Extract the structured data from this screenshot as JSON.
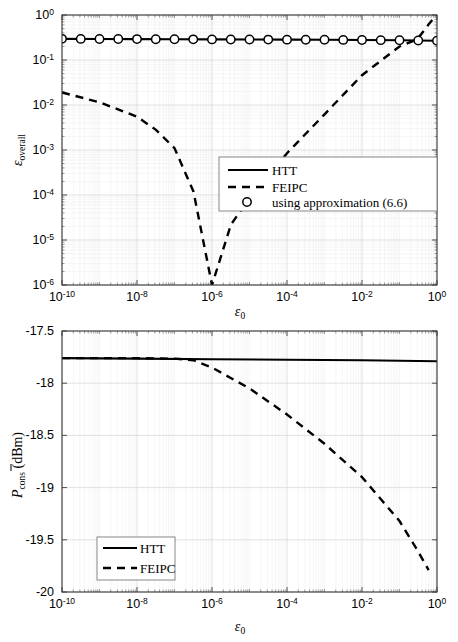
{
  "figure": {
    "panels": [
      "top",
      "bottom"
    ]
  },
  "chart_data": [
    {
      "id": "overall-error-vs-epsilon0",
      "type": "line",
      "title": "",
      "xlabel": "ε₀",
      "xlabel_base": "ε",
      "xlabel_sub": "0",
      "ylabel": "ε_overall",
      "ylabel_base": "ε",
      "ylabel_sub": "overall",
      "xscale": "log",
      "yscale": "log",
      "xlim": [
        1e-10,
        1
      ],
      "ylim": [
        1e-06,
        1
      ],
      "grid": true,
      "xticks": [
        1e-10,
        1e-08,
        1e-06,
        0.0001,
        0.01,
        1
      ],
      "xtick_labels": [
        "10-10",
        "10-8",
        "10-6",
        "10-4",
        "10-2",
        "100"
      ],
      "xtick_bases": [
        "10",
        "10",
        "10",
        "10",
        "10",
        "10"
      ],
      "xtick_exps": [
        "-10",
        "-8",
        "-6",
        "-4",
        "-2",
        "0"
      ],
      "yticks": [
        1e-06,
        1e-05,
        0.0001,
        0.001,
        0.01,
        0.1,
        1
      ],
      "ytick_bases": [
        "10",
        "10",
        "10",
        "10",
        "10",
        "10",
        "10"
      ],
      "ytick_exps": [
        "-6",
        "-5",
        "-4",
        "-3",
        "-2",
        "-1",
        "0"
      ],
      "legend_position": "center-right",
      "series": [
        {
          "name": "HTT",
          "style": "solid",
          "x": [
            1e-10,
            1e-09,
            1e-08,
            1e-07,
            1e-06,
            1e-05,
            0.0001,
            0.001,
            0.01,
            0.1,
            1
          ],
          "y": [
            0.295,
            0.293,
            0.291,
            0.289,
            0.287,
            0.285,
            0.283,
            0.281,
            0.278,
            0.274,
            0.268
          ]
        },
        {
          "name": "FEIPC",
          "style": "dashed",
          "x": [
            1e-10,
            1e-09,
            1e-08,
            3.2e-08,
            1e-07,
            3.2e-07,
            1e-06,
            3.2e-06,
            1e-05,
            0.0001,
            0.001,
            0.01,
            0.1,
            0.3,
            0.6,
            1
          ],
          "y": [
            0.019,
            0.0115,
            0.0055,
            0.0028,
            0.0011,
            0.00012,
            1e-06,
            2.2e-05,
            8.5e-05,
            0.00085,
            0.0062,
            0.046,
            0.2,
            0.29,
            0.62,
            1.05
          ]
        },
        {
          "name": "using approximation (6.6)",
          "style": "markers",
          "marker": "circle",
          "x": [
            1e-10,
            6.3e-10,
            4e-09,
            2.5e-08,
            1.6e-07,
            1e-06,
            6.3e-06,
            4e-05,
            0.00025,
            0.0016,
            0.01,
            0.063,
            0.4,
            1.0
          ],
          "y": [
            0.295,
            0.294,
            0.293,
            0.291,
            0.289,
            0.287,
            0.285,
            0.284,
            0.282,
            0.28,
            0.278,
            0.275,
            0.271,
            0.268
          ],
          "marker_count": 21
        }
      ],
      "legend": [
        {
          "label": "HTT",
          "style": "solid"
        },
        {
          "label": "FEIPC",
          "style": "dashed"
        },
        {
          "label": "using approximation (6.6)",
          "style": "marker-circle"
        }
      ]
    },
    {
      "id": "average-power-consumption-vs-epsilon0",
      "type": "line",
      "title": "",
      "xlabel": "ε₀",
      "xlabel_base": "ε",
      "xlabel_sub": "0",
      "ylabel": "P̄_cons (dBm)",
      "ylabel_base": "P",
      "ylabel_sub": "cons",
      "ylabel_unit": "(dBm)",
      "xscale": "log",
      "yscale": "linear",
      "xlim": [
        1e-10,
        1
      ],
      "ylim": [
        -20,
        -17.5
      ],
      "grid": true,
      "xticks": [
        1e-10,
        1e-08,
        1e-06,
        0.0001,
        0.01,
        1
      ],
      "xtick_bases": [
        "10",
        "10",
        "10",
        "10",
        "10",
        "10"
      ],
      "xtick_exps": [
        "-10",
        "-8",
        "-6",
        "-4",
        "-2",
        "0"
      ],
      "yticks": [
        -20,
        -19.5,
        -19,
        -18.5,
        -18,
        -17.5
      ],
      "ytick_labels": [
        "-20",
        "-19.5",
        "-19",
        "-18.5",
        "-18",
        "-17.5"
      ],
      "legend_position": "bottom-left",
      "series": [
        {
          "name": "HTT",
          "style": "solid",
          "x": [
            1e-10,
            1e-08,
            1e-06,
            0.0001,
            0.01,
            1
          ],
          "y": [
            -17.76,
            -17.765,
            -17.77,
            -17.775,
            -17.78,
            -17.79
          ]
        },
        {
          "name": "FEIPC",
          "style": "dashed",
          "x": [
            1e-10,
            1e-08,
            1e-07,
            3.2e-07,
            1e-06,
            1e-05,
            0.0001,
            0.001,
            0.01,
            0.1,
            0.3,
            0.6
          ],
          "y": [
            -17.76,
            -17.76,
            -17.765,
            -17.78,
            -17.85,
            -18.05,
            -18.3,
            -18.58,
            -18.9,
            -19.32,
            -19.6,
            -19.79
          ]
        }
      ],
      "legend": [
        {
          "label": "HTT",
          "style": "solid"
        },
        {
          "label": "FEIPC",
          "style": "dashed"
        }
      ]
    }
  ]
}
